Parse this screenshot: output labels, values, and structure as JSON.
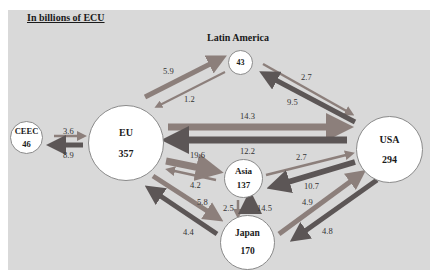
{
  "title": "In billions of ECU",
  "colors": {
    "background": "#d9d9d9",
    "arrow_light": "#8c7f7b",
    "arrow_dark": "#5c5656",
    "node_fill": "#ffffff"
  },
  "regions": {
    "latin_america": {
      "name": "Latin America",
      "value": "43"
    },
    "ceec": {
      "name": "CEEC",
      "value": "46"
    },
    "eu": {
      "name": "EU",
      "value": "357"
    },
    "usa": {
      "name": "USA",
      "value": "294"
    },
    "asia": {
      "name": "Asia",
      "value": "137"
    },
    "japan": {
      "name": "Japan",
      "value": "170"
    }
  },
  "flows": [
    {
      "id": "eu_to_latam",
      "from": "EU",
      "to": "Latin America",
      "value": "5.9"
    },
    {
      "id": "latam_to_eu",
      "from": "Latin America",
      "to": "EU",
      "value": "1.2"
    },
    {
      "id": "latam_to_usa",
      "from": "Latin America",
      "to": "USA",
      "value": "2.7"
    },
    {
      "id": "usa_to_latam",
      "from": "USA",
      "to": "Latin America",
      "value": "9.5"
    },
    {
      "id": "eu_to_ceec",
      "from": "EU",
      "to": "CEEC",
      "value": "8.9"
    },
    {
      "id": "ceec_to_eu",
      "from": "CEEC",
      "to": "EU",
      "value": "3.6"
    },
    {
      "id": "eu_to_usa",
      "from": "EU",
      "to": "USA",
      "value": "14.3"
    },
    {
      "id": "usa_to_eu",
      "from": "USA",
      "to": "EU",
      "value": "12.2"
    },
    {
      "id": "eu_to_asia",
      "from": "EU",
      "to": "Asia",
      "value": "19.6"
    },
    {
      "id": "asia_to_eu",
      "from": "Asia",
      "to": "EU",
      "value": "4.2"
    },
    {
      "id": "eu_to_japan",
      "from": "EU",
      "to": "Japan",
      "value": "5.8"
    },
    {
      "id": "japan_to_eu",
      "from": "Japan",
      "to": "EU",
      "value": "4.4"
    },
    {
      "id": "asia_to_usa",
      "from": "Asia",
      "to": "USA",
      "value": "2.7"
    },
    {
      "id": "usa_to_asia",
      "from": "USA",
      "to": "Asia",
      "value": "10.7"
    },
    {
      "id": "asia_to_japan",
      "from": "Asia",
      "to": "Japan",
      "value": "2.5"
    },
    {
      "id": "japan_to_asia",
      "from": "Japan",
      "to": "Asia",
      "value": "14.5"
    },
    {
      "id": "japan_to_usa",
      "from": "Japan",
      "to": "USA",
      "value": "4.9"
    },
    {
      "id": "usa_to_japan",
      "from": "USA",
      "to": "Japan",
      "value": "4.8"
    }
  ]
}
